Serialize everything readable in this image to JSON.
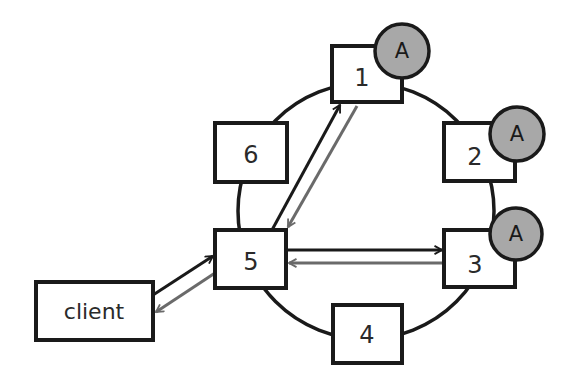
{
  "diagram": {
    "title": "",
    "colors": {
      "stroke": "#1a1a1a",
      "badge_fill": "#a8a8a8",
      "request_arrow": "#1a1a1a",
      "response_arrow": "#6a6a6a",
      "background": "#ffffff"
    },
    "ring": {
      "cx": 366,
      "cy": 211,
      "r": 128
    },
    "client": {
      "label": "client",
      "x": 36,
      "y": 282,
      "w": 117,
      "h": 58
    },
    "nodes": [
      {
        "id": "1",
        "label": "1",
        "x": 332,
        "y": 46,
        "w": 70,
        "h": 56,
        "badge": "A",
        "badge_cx": 402,
        "badge_cy": 51
      },
      {
        "id": "2",
        "label": "2",
        "x": 444,
        "y": 123,
        "w": 71,
        "h": 58,
        "badge": "A",
        "badge_cx": 517,
        "badge_cy": 134
      },
      {
        "id": "3",
        "label": "3",
        "x": 444,
        "y": 230,
        "w": 71,
        "h": 57,
        "badge": "A",
        "badge_cx": 516,
        "badge_cy": 234
      },
      {
        "id": "4",
        "label": "4",
        "x": 333,
        "y": 305,
        "w": 69,
        "h": 58,
        "badge": null
      },
      {
        "id": "5",
        "label": "5",
        "x": 215,
        "y": 230,
        "w": 71,
        "h": 58,
        "badge": null
      },
      {
        "id": "6",
        "label": "6",
        "x": 215,
        "y": 123,
        "w": 72,
        "h": 59,
        "badge": null
      }
    ],
    "edges": [
      {
        "from": "client",
        "to": "5",
        "kind": "request"
      },
      {
        "from": "5",
        "to": "client",
        "kind": "response"
      },
      {
        "from": "5",
        "to": "1",
        "kind": "request"
      },
      {
        "from": "1",
        "to": "5",
        "kind": "response"
      },
      {
        "from": "5",
        "to": "3",
        "kind": "request"
      },
      {
        "from": "3",
        "to": "5",
        "kind": "response"
      }
    ]
  }
}
